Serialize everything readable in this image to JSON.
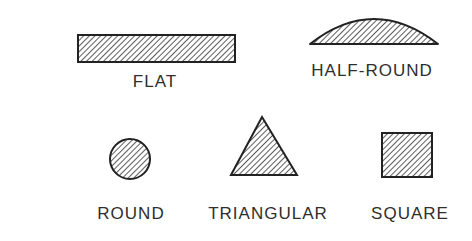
{
  "diagram": {
    "background": "#ffffff",
    "stroke_color": "#222222",
    "hatch_color": "#333333",
    "text_color": "#2e2e2e",
    "shapes": [
      {
        "id": "flat",
        "label": "FLAT",
        "shape": "rectangle"
      },
      {
        "id": "half-round",
        "label": "HALF-ROUND",
        "shape": "half-ellipse"
      },
      {
        "id": "round",
        "label": "ROUND",
        "shape": "circle"
      },
      {
        "id": "triangular",
        "label": "TRIANGULAR",
        "shape": "triangle"
      },
      {
        "id": "square",
        "label": "SQUARE",
        "shape": "square"
      }
    ]
  }
}
